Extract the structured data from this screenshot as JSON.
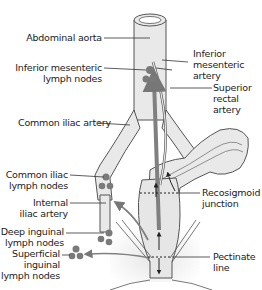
{
  "labels": {
    "abdominal_aorta": "Abdominal aorta",
    "inferior_mesenteric_artery": "Inferior\nmesenteric\nartery",
    "inferior_mesenteric_lymph_nodes": "Inferior mesenteric\nlymph nodes",
    "superior_rectal_artery": "Superior\nrectal\nartery",
    "common_iliac_artery": "Common iliac artery",
    "common_iliac_lymph_nodes": "Common iliac\nlymph nodes",
    "internal_iliac_artery": "Internal\niliac artery",
    "recosigmoid_junction": "Recosigmoid\njunction",
    "deep_inguinal_lymph_nodes": "Deep inguinal\nlymph nodes",
    "superficial_inguinal_lymph_nodes": "Superficial\ninguinal\nlymph nodes",
    "pectinate_line": "Pectinate\nline"
  },
  "colors": {
    "vessel_fill": "#e9e9e9",
    "outline": "#555555",
    "node": "#7a7a7a",
    "arrow": "#808080"
  }
}
